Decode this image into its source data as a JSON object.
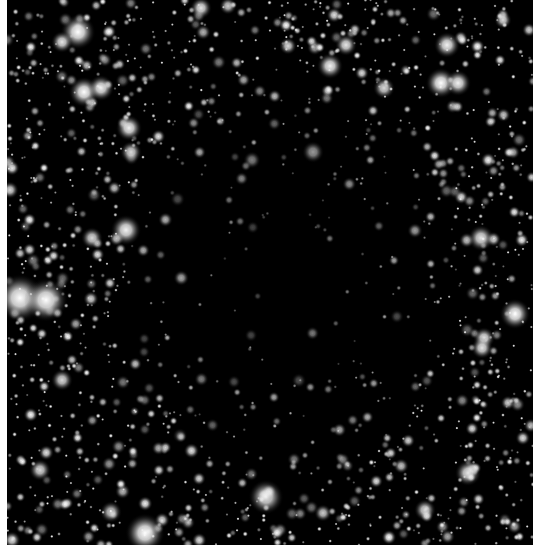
{
  "image": {
    "subject": "star field with dark nebula (dark cloud) in center",
    "background_color": "#000000",
    "border_color": "#ffffff",
    "field": {
      "x": 7,
      "y": 0,
      "width": 526,
      "height": 545
    },
    "dark_region": {
      "cx": 290,
      "cy": 270,
      "rx": 175,
      "ry": 200
    },
    "faint_star_count": 1900,
    "seed": 12345,
    "bright_stars": [
      {
        "x": 20,
        "y": 298,
        "r": 11,
        "b": 1.0
      },
      {
        "x": 46,
        "y": 300,
        "r": 10,
        "b": 1.0
      },
      {
        "x": 78,
        "y": 32,
        "r": 8,
        "b": 1.0
      },
      {
        "x": 84,
        "y": 92,
        "r": 7,
        "b": 1.0
      },
      {
        "x": 101,
        "y": 88,
        "r": 6,
        "b": 0.95
      },
      {
        "x": 62,
        "y": 42,
        "r": 5,
        "b": 0.9
      },
      {
        "x": 129,
        "y": 128,
        "r": 6,
        "b": 0.95
      },
      {
        "x": 126,
        "y": 230,
        "r": 7,
        "b": 0.95
      },
      {
        "x": 92,
        "y": 238,
        "r": 5,
        "b": 0.85
      },
      {
        "x": 131,
        "y": 152,
        "r": 5,
        "b": 0.85
      },
      {
        "x": 145,
        "y": 533,
        "r": 9,
        "b": 1.0
      },
      {
        "x": 266,
        "y": 497,
        "r": 8,
        "b": 0.9
      },
      {
        "x": 330,
        "y": 66,
        "r": 6,
        "b": 0.95
      },
      {
        "x": 346,
        "y": 45,
        "r": 5,
        "b": 0.9
      },
      {
        "x": 447,
        "y": 45,
        "r": 6,
        "b": 0.95
      },
      {
        "x": 441,
        "y": 83,
        "r": 7,
        "b": 1.0
      },
      {
        "x": 458,
        "y": 83,
        "r": 6,
        "b": 0.95
      },
      {
        "x": 384,
        "y": 88,
        "r": 5,
        "b": 0.85
      },
      {
        "x": 481,
        "y": 238,
        "r": 6,
        "b": 0.9
      },
      {
        "x": 515,
        "y": 314,
        "r": 7,
        "b": 1.0
      },
      {
        "x": 484,
        "y": 338,
        "r": 5,
        "b": 0.9
      },
      {
        "x": 482,
        "y": 348,
        "r": 5,
        "b": 0.9
      },
      {
        "x": 468,
        "y": 473,
        "r": 6,
        "b": 0.9
      },
      {
        "x": 201,
        "y": 8,
        "r": 5,
        "b": 0.9
      },
      {
        "x": 288,
        "y": 46,
        "r": 4,
        "b": 0.85
      },
      {
        "x": 228,
        "y": 6,
        "r": 4,
        "b": 0.8
      },
      {
        "x": 62,
        "y": 380,
        "r": 5,
        "b": 0.85
      },
      {
        "x": 40,
        "y": 470,
        "r": 5,
        "b": 0.85
      },
      {
        "x": 111,
        "y": 512,
        "r": 5,
        "b": 0.8
      },
      {
        "x": 313,
        "y": 152,
        "r": 5,
        "b": 0.6
      },
      {
        "x": 252,
        "y": 160,
        "r": 4,
        "b": 0.5
      },
      {
        "x": 323,
        "y": 513,
        "r": 4,
        "b": 0.8
      },
      {
        "x": 425,
        "y": 510,
        "r": 5,
        "b": 0.85
      },
      {
        "x": 503,
        "y": 20,
        "r": 4,
        "b": 0.85
      },
      {
        "x": 10,
        "y": 190,
        "r": 4,
        "b": 0.85
      },
      {
        "x": 12,
        "y": 540,
        "r": 4,
        "b": 0.85
      }
    ]
  }
}
